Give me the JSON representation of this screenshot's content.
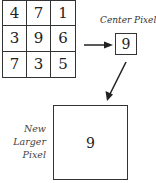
{
  "grid": {
    "rows": [
      [
        "4",
        "7",
        "1"
      ],
      [
        "3",
        "9",
        "6"
      ],
      [
        "7",
        "3",
        "5"
      ]
    ]
  },
  "center_pixel": {
    "label": "Center Pixel",
    "value": "9"
  },
  "new_pixel": {
    "label_lines": [
      "New",
      "Larger",
      "Pixel"
    ],
    "value": "9"
  }
}
